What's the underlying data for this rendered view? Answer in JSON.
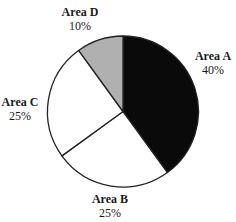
{
  "chart_data": {
    "type": "pie",
    "title": "",
    "categories": [
      "Area A",
      "Area B",
      "Area C",
      "Area D"
    ],
    "values": [
      40,
      25,
      25,
      10
    ],
    "value_labels": [
      "40%",
      "25%",
      "25%",
      "10%"
    ],
    "colors": [
      "#0a0a0a",
      "#ffffff",
      "#ffffff",
      "#b0b0b0"
    ],
    "start_angle_deg": 0,
    "direction": "clockwise",
    "legend": "none",
    "labels_position": "outside"
  },
  "labels": {
    "a": {
      "name": "Area A",
      "pct": "40%"
    },
    "b": {
      "name": "Area B",
      "pct": "25%"
    },
    "c": {
      "name": "Area C",
      "pct": "25%"
    },
    "d": {
      "name": "Area D",
      "pct": "10%"
    }
  }
}
